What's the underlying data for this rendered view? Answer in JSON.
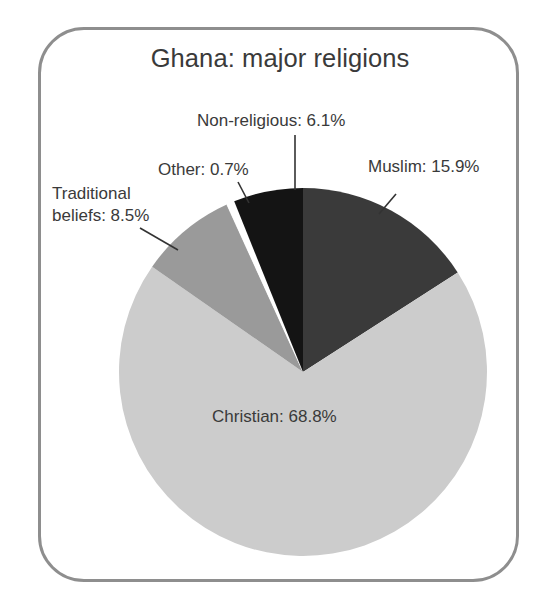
{
  "figure": {
    "title": "Ghana: major religions",
    "frame_color": "#8e8e8e",
    "background_color": "#ffffff"
  },
  "chart_data": {
    "type": "pie",
    "title": "Ghana: major religions",
    "xlabel": "",
    "ylabel": "",
    "legend_position": "none",
    "grid": false,
    "units": "percent",
    "start_angle_deg": 0,
    "direction": "clockwise",
    "center": {
      "x": 303,
      "y": 372
    },
    "radius": 184,
    "categories": [
      "Muslim",
      "Christian",
      "Traditional beliefs",
      "Other",
      "Non-religious"
    ],
    "values": [
      15.9,
      68.8,
      8.5,
      0.7,
      6.1
    ],
    "slices": [
      {
        "name": "Muslim",
        "value": 15.9,
        "label": "Muslim: 15.9%",
        "color": "#3a3a3a",
        "start_deg": 0,
        "end_deg": 57.24,
        "leader_line": {
          "x1": 396,
          "y1": 194,
          "x2": 379,
          "y2": 214
        }
      },
      {
        "name": "Christian",
        "value": 68.8,
        "label": "Christian: 68.8%",
        "color": "#cccccc",
        "start_deg": 57.24,
        "end_deg": 304.92,
        "leader_line": null
      },
      {
        "name": "Traditional beliefs",
        "value": 8.5,
        "label_line1": "Traditional",
        "label_line2": "beliefs: 8.5%",
        "label": "Traditional beliefs: 8.5%",
        "color": "#9a9a9a",
        "start_deg": 304.92,
        "end_deg": 335.52,
        "leader_line": {
          "x1": 140,
          "y1": 228,
          "x2": 178,
          "y2": 250
        }
      },
      {
        "name": "Other",
        "value": 0.7,
        "label": "Other: 0.7%",
        "color": "#ffffff",
        "start_deg": 335.52,
        "end_deg": 338.04,
        "leader_line": {
          "x1": 238,
          "y1": 182,
          "x2": 249,
          "y2": 203
        }
      },
      {
        "name": "Non-religious",
        "value": 6.1,
        "label": "Non-religious: 6.1%",
        "color": "#141414",
        "start_deg": 338.04,
        "end_deg": 360,
        "leader_line": {
          "x1": 295,
          "y1": 135,
          "x2": 295,
          "y2": 190
        }
      }
    ]
  }
}
